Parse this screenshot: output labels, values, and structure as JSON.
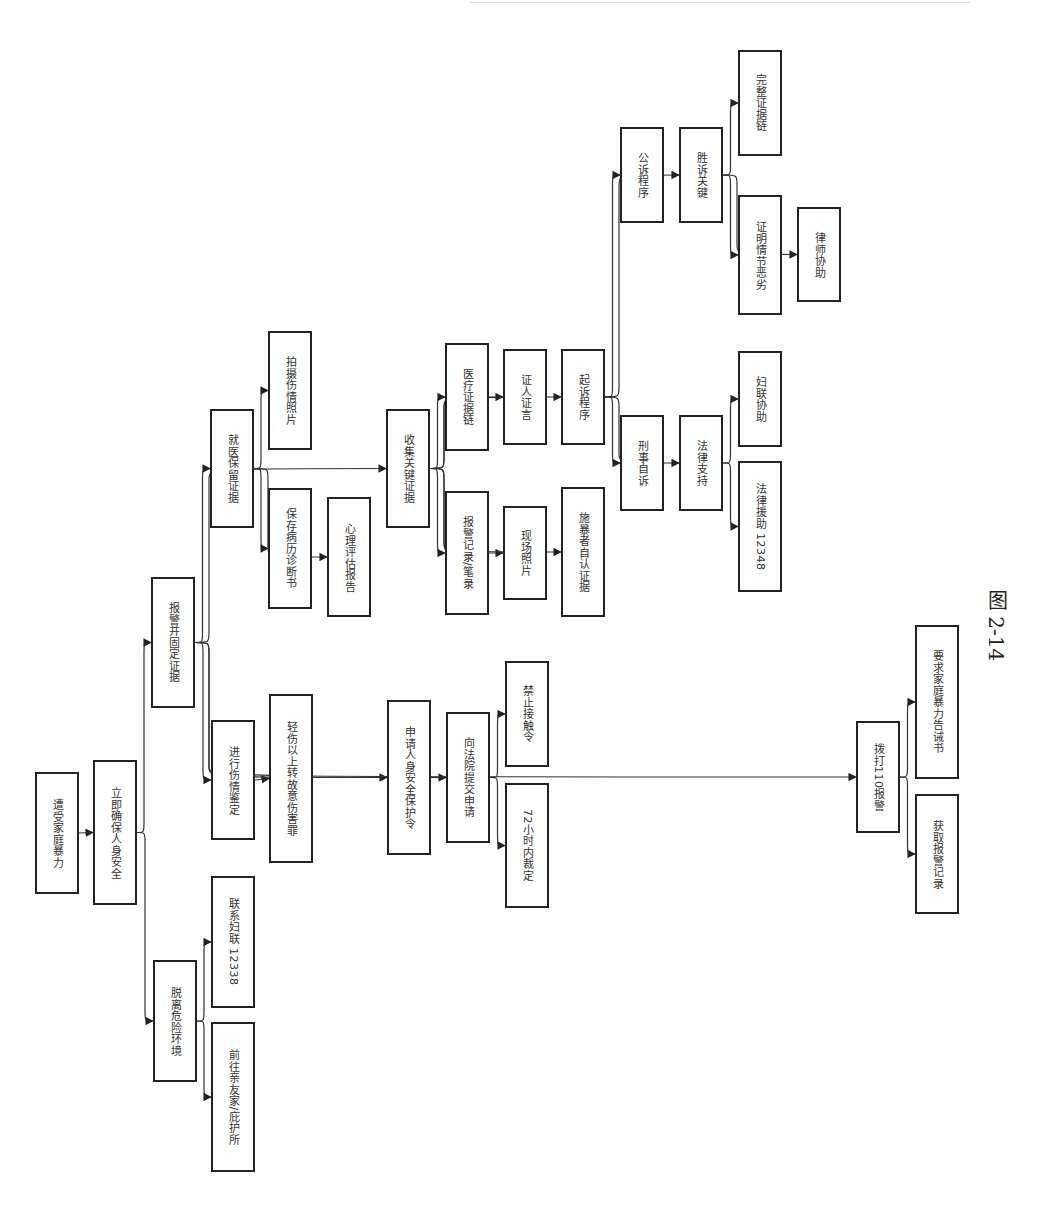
{
  "figure_caption": "图 2-14",
  "orientation": "rotated-90-clockwise",
  "nodes": [
    {
      "id": "n0",
      "label": "遭受家庭暴力",
      "x": 35,
      "y": 772,
      "w": 44,
      "h": 122
    },
    {
      "id": "n1",
      "label": "立即确保人身安全",
      "x": 93,
      "y": 760,
      "w": 44,
      "h": 145
    },
    {
      "id": "n2",
      "label": "脱离危险环境",
      "x": 153,
      "y": 960,
      "w": 44,
      "h": 122
    },
    {
      "id": "n3",
      "label": "联系妇联 12338",
      "x": 211,
      "y": 876,
      "w": 44,
      "h": 132
    },
    {
      "id": "n4",
      "label": "前往亲友家/庇护所",
      "x": 211,
      "y": 1022,
      "w": 44,
      "h": 150
    },
    {
      "id": "n5",
      "label": "报警并固定证据",
      "x": 151,
      "y": 577,
      "w": 44,
      "h": 131
    },
    {
      "id": "n6",
      "label": "进行伤情鉴定",
      "x": 211,
      "y": 720,
      "w": 44,
      "h": 120
    },
    {
      "id": "n7",
      "label": "轻伤以上转故意伤害罪",
      "x": 269,
      "y": 694,
      "w": 44,
      "h": 169
    },
    {
      "id": "n8",
      "label": "就医保留证据",
      "x": 210,
      "y": 409,
      "w": 44,
      "h": 119
    },
    {
      "id": "n9",
      "label": "拍摄伤情照片",
      "x": 268,
      "y": 331,
      "w": 44,
      "h": 119
    },
    {
      "id": "n10",
      "label": "保存病历诊断书",
      "x": 268,
      "y": 488,
      "w": 44,
      "h": 121
    },
    {
      "id": "n11",
      "label": "心理评估报告",
      "x": 327,
      "y": 497,
      "w": 44,
      "h": 120
    },
    {
      "id": "n12",
      "label": "收集关键证据",
      "x": 386,
      "y": 409,
      "w": 44,
      "h": 119
    },
    {
      "id": "n13",
      "label": "医疗证据链",
      "x": 445,
      "y": 343,
      "w": 44,
      "h": 108
    },
    {
      "id": "n14",
      "label": "报警记录/笔录",
      "x": 445,
      "y": 491,
      "w": 44,
      "h": 124
    },
    {
      "id": "n15",
      "label": "证人证言",
      "x": 503,
      "y": 349,
      "w": 44,
      "h": 96
    },
    {
      "id": "n16",
      "label": "现场照片",
      "x": 503,
      "y": 506,
      "w": 44,
      "h": 94
    },
    {
      "id": "n17",
      "label": "起诉程序",
      "x": 561,
      "y": 349,
      "w": 44,
      "h": 96
    },
    {
      "id": "n18",
      "label": "施暴者自认证据",
      "x": 561,
      "y": 487,
      "w": 44,
      "h": 130
    },
    {
      "id": "n19",
      "label": "公诉程序",
      "x": 620,
      "y": 127,
      "w": 44,
      "h": 96
    },
    {
      "id": "n20",
      "label": "胜诉关键",
      "x": 679,
      "y": 127,
      "w": 44,
      "h": 96
    },
    {
      "id": "n21",
      "label": "完整证据链",
      "x": 738,
      "y": 50,
      "w": 44,
      "h": 106
    },
    {
      "id": "n22",
      "label": "证明情节恶劣",
      "x": 738,
      "y": 195,
      "w": 44,
      "h": 120
    },
    {
      "id": "n23",
      "label": "律师协助",
      "x": 797,
      "y": 207,
      "w": 44,
      "h": 95
    },
    {
      "id": "n24",
      "label": "刑事自诉",
      "x": 620,
      "y": 415,
      "w": 44,
      "h": 96
    },
    {
      "id": "n25",
      "label": "法律支持",
      "x": 679,
      "y": 415,
      "w": 44,
      "h": 96
    },
    {
      "id": "n26",
      "label": "妇联协助",
      "x": 738,
      "y": 351,
      "w": 44,
      "h": 96
    },
    {
      "id": "n27",
      "label": "法律援助 12348",
      "x": 738,
      "y": 461,
      "w": 44,
      "h": 131
    },
    {
      "id": "n28",
      "label": "申请人身安全保护令",
      "x": 387,
      "y": 700,
      "w": 44,
      "h": 155
    },
    {
      "id": "n29",
      "label": "向法院提交申请",
      "x": 446,
      "y": 712,
      "w": 44,
      "h": 131
    },
    {
      "id": "n30",
      "label": "禁止接触令",
      "x": 505,
      "y": 661,
      "w": 44,
      "h": 106
    },
    {
      "id": "n31",
      "label": "72小时内裁定",
      "x": 505,
      "y": 783,
      "w": 44,
      "h": 125
    },
    {
      "id": "n32",
      "label": "拨打110报警",
      "x": 856,
      "y": 721,
      "w": 44,
      "h": 112
    },
    {
      "id": "n33",
      "label": "要求家庭暴力告诫书",
      "x": 915,
      "y": 625,
      "w": 44,
      "h": 154
    },
    {
      "id": "n34",
      "label": "获取报警记录",
      "x": 915,
      "y": 794,
      "w": 44,
      "h": 120
    }
  ],
  "edges": [
    [
      "n0",
      "n1"
    ],
    [
      "n1",
      "n2"
    ],
    [
      "n1",
      "n5"
    ],
    [
      "n2",
      "n3"
    ],
    [
      "n2",
      "n4"
    ],
    [
      "n5",
      "n6"
    ],
    [
      "n6",
      "n7"
    ],
    [
      "n5",
      "n8"
    ],
    [
      "n8",
      "n9"
    ],
    [
      "n8",
      "n10"
    ],
    [
      "n8",
      "n11"
    ],
    [
      "n5",
      "n12"
    ],
    [
      "n12",
      "n13"
    ],
    [
      "n12",
      "n14"
    ],
    [
      "n12",
      "n15"
    ],
    [
      "n12",
      "n16"
    ],
    [
      "n12",
      "n17"
    ],
    [
      "n12",
      "n18"
    ],
    [
      "n17",
      "n19"
    ],
    [
      "n17",
      "n20"
    ],
    [
      "n20",
      "n21"
    ],
    [
      "n20",
      "n22"
    ],
    [
      "n20",
      "n23"
    ],
    [
      "n17",
      "n24"
    ],
    [
      "n17",
      "n25"
    ],
    [
      "n25",
      "n26"
    ],
    [
      "n25",
      "n27"
    ],
    [
      "n5",
      "n28"
    ],
    [
      "n28",
      "n29"
    ],
    [
      "n29",
      "n30"
    ],
    [
      "n29",
      "n31"
    ],
    [
      "n5",
      "n32"
    ],
    [
      "n32",
      "n33"
    ],
    [
      "n32",
      "n34"
    ]
  ],
  "style": {
    "stroke": "#333333",
    "node_border": "#222222",
    "background": "#ffffff"
  }
}
